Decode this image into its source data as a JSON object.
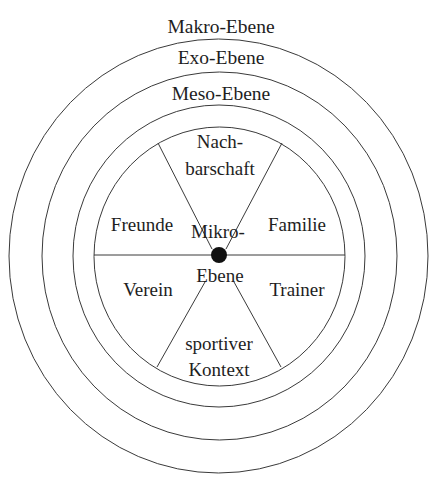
{
  "diagram": {
    "type": "concentric-ecological-model",
    "levels": [
      {
        "id": "makro",
        "label": "Makro-Ebene"
      },
      {
        "id": "exo",
        "label": "Exo-Ebene"
      },
      {
        "id": "meso",
        "label": "Meso-Ebene"
      },
      {
        "id": "mikro",
        "label_line1": "Mikro-",
        "label_line2": "Ebene"
      }
    ],
    "segments": [
      {
        "id": "nachbarschaft",
        "line1": "Nach-",
        "line2": "barschaft"
      },
      {
        "id": "familie",
        "label": "Familie"
      },
      {
        "id": "trainer",
        "label": "Trainer"
      },
      {
        "id": "sportiver-kontext",
        "line1": "sportiver",
        "line2": "Kontext"
      },
      {
        "id": "verein",
        "label": "Verein"
      },
      {
        "id": "freunde",
        "label": "Freunde"
      }
    ],
    "colors": {
      "line": "#3a3a3a",
      "text": "#1e1e1e",
      "center_dot": "#111111",
      "background": "#ffffff"
    }
  }
}
